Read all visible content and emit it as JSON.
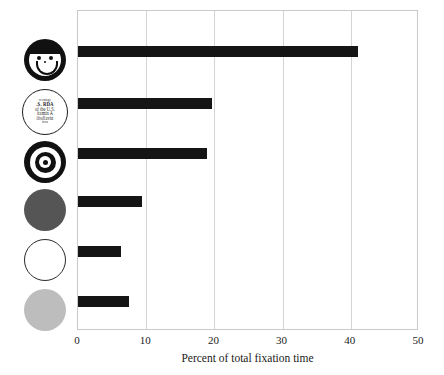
{
  "chart_data": {
    "type": "bar",
    "orientation": "horizontal",
    "title": "",
    "xlabel": "Percent of total fixation time",
    "ylabel": "",
    "xlim": [
      0,
      50
    ],
    "xticks": [
      0,
      10,
      20,
      30,
      40,
      50
    ],
    "xtick_labels": [
      "0",
      "10",
      "20",
      "30",
      "40",
      "50"
    ],
    "grid": true,
    "grid_axis": "x",
    "legend": "none",
    "bar_color": "#151515",
    "categories": [
      "smiley-face",
      "nutrition-label",
      "bullseye-target",
      "dark-gray-disc",
      "white-disc",
      "light-gray-disc"
    ],
    "values": [
      41.1,
      19.6,
      18.9,
      9.4,
      6.3,
      7.5
    ]
  },
  "axis": {
    "x_title": "Percent of total fixation time",
    "ticks": [
      {
        "value": 0,
        "label": "0"
      },
      {
        "value": 10,
        "label": "10"
      },
      {
        "value": 20,
        "label": "20"
      },
      {
        "value": 30,
        "label": "30"
      },
      {
        "value": 40,
        "label": "40"
      },
      {
        "value": 50,
        "label": "50"
      }
    ]
  },
  "icons": [
    {
      "name": "smiley-face-icon",
      "kind": "smiley",
      "color": "#111111"
    },
    {
      "name": "nutrition-label-icon",
      "kind": "label-disc",
      "color": "#1d1d1d",
      "lines": [
        "rcentage",
        ".S.  RDA",
        "of the U.S.",
        "itamin A",
        "iboflavin",
        "iron"
      ]
    },
    {
      "name": "bullseye-target-icon",
      "kind": "target",
      "color": "#111111"
    },
    {
      "name": "dark-gray-disc-icon",
      "kind": "disc-dark",
      "color": "#555555"
    },
    {
      "name": "white-disc-icon",
      "kind": "disc-white",
      "color": "#ffffff"
    },
    {
      "name": "light-gray-disc-icon",
      "kind": "disc-light",
      "color": "#bdbdbd"
    }
  ]
}
